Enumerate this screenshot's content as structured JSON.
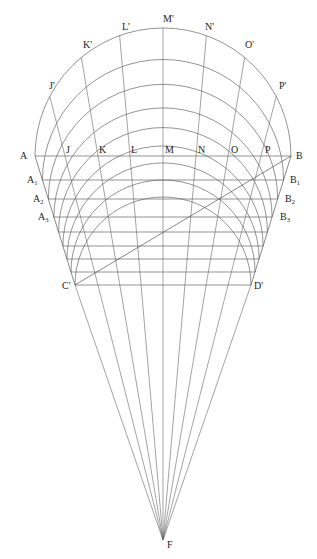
{
  "diagram": {
    "type": "geometric-construction",
    "stroke_color": "#555555",
    "background": "#ffffff",
    "center_x": 163,
    "base_y": 156,
    "outer_radius": 128,
    "apex": {
      "label": "F",
      "x": 163,
      "y": 540
    },
    "outer_arc_labels": [
      {
        "label": "J'",
        "x": 49,
        "y": 89
      },
      {
        "label": "K'",
        "x": 83,
        "y": 48
      },
      {
        "label": "L'",
        "x": 122,
        "y": 30
      },
      {
        "label": "M'",
        "x": 163,
        "y": 22
      },
      {
        "label": "N'",
        "x": 205,
        "y": 30
      },
      {
        "label": "O'",
        "x": 245,
        "y": 48
      },
      {
        "label": "P'",
        "x": 279,
        "y": 89
      }
    ],
    "baseline_labels": [
      {
        "label": "A",
        "x": 20,
        "y": 159
      },
      {
        "label": "J",
        "x": 66,
        "y": 153
      },
      {
        "label": "K",
        "x": 99,
        "y": 153
      },
      {
        "label": "L",
        "x": 131,
        "y": 153
      },
      {
        "label": "M",
        "x": 165,
        "y": 153
      },
      {
        "label": "N",
        "x": 198,
        "y": 153
      },
      {
        "label": "O",
        "x": 231,
        "y": 153
      },
      {
        "label": "P",
        "x": 265,
        "y": 153
      },
      {
        "label": "B",
        "x": 296,
        "y": 159
      }
    ],
    "left_labels": [
      {
        "label": "A",
        "sub": "1",
        "x": 27,
        "y": 183
      },
      {
        "label": "A",
        "sub": "2",
        "x": 33,
        "y": 202
      },
      {
        "label": "A",
        "sub": "3",
        "x": 38,
        "y": 220
      },
      {
        "label": "C'",
        "x": 62,
        "y": 289
      }
    ],
    "right_labels": [
      {
        "label": "B",
        "sub": "1",
        "x": 290,
        "y": 183
      },
      {
        "label": "B",
        "sub": "2",
        "x": 285,
        "y": 202
      },
      {
        "label": "B",
        "sub": "3",
        "x": 280,
        "y": 220
      },
      {
        "label": "D'",
        "x": 254,
        "y": 289
      }
    ],
    "horizontal_levels_y": [
      156,
      180,
      199,
      217,
      232,
      246,
      259,
      272,
      285
    ],
    "diagonal": {
      "from": "C'",
      "to": "B"
    },
    "radial_points_baseline_x": [
      65,
      98,
      130,
      163,
      196,
      228,
      261
    ]
  }
}
